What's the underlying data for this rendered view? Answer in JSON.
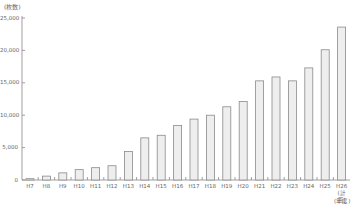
{
  "chart_data": {
    "type": "bar",
    "title": "",
    "ylabel": "(枚数)",
    "xlabel": "(年度)",
    "ylim": [
      0,
      25000
    ],
    "yticks": [
      0,
      5000,
      10000,
      15000,
      20000,
      25000
    ],
    "ytick_labels": [
      "0",
      "5,000",
      "10,000",
      "15,000",
      "20,000",
      "25,000"
    ],
    "grid": false,
    "legend": null,
    "categories": [
      "H7",
      "H8",
      "H9",
      "H10",
      "H11",
      "H12",
      "H13",
      "H14",
      "H15",
      "H16",
      "H17",
      "H18",
      "H19",
      "H20",
      "H21",
      "H22",
      "H23",
      "H24",
      "H25",
      "H26"
    ],
    "category_sublabels": {
      "H26": "(計画)"
    },
    "values": [
      200,
      600,
      1100,
      1600,
      1900,
      2200,
      4400,
      6500,
      6900,
      8400,
      9400,
      10000,
      11300,
      12100,
      15300,
      15900,
      15300,
      17300,
      20100,
      23600
    ],
    "colors": {
      "bar_fill": "#eeeeee",
      "bar_stroke": "#8a8a8a",
      "axis": "#888888"
    }
  },
  "labels": {
    "unit": "(枚数)",
    "x_unit": "(年度)"
  }
}
